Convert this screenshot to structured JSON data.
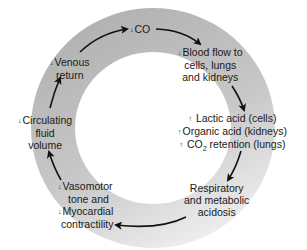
{
  "diagram": {
    "type": "cycle",
    "colors": {
      "ring_dark": "#b4b4b4",
      "ring_light": "#efefef",
      "arrow": "#111111",
      "text": "#1a1a1a"
    },
    "nodes": [
      {
        "id": "co",
        "arrow": "↓",
        "lines": [
          "CO"
        ]
      },
      {
        "id": "blood_flow",
        "arrow": "↓",
        "lines": [
          "Blood flow to",
          "cells, lungs",
          "and  kidneys"
        ]
      },
      {
        "id": "acids",
        "lines": [
          {
            "arrow": "↑",
            "text": "Lactic acid (cells)"
          },
          {
            "arrow": "↑",
            "text": "Organic acid (kidneys)"
          },
          {
            "arrow": "↑",
            "text_pre": "CO",
            "sub": "2",
            "text_post": " retention (lungs)"
          }
        ]
      },
      {
        "id": "acidosis",
        "lines": [
          "Respiratory",
          "and metabolic",
          "acidosis"
        ]
      },
      {
        "id": "vasomotor",
        "lines": [
          {
            "arrow": "↓",
            "text": "Vasomotor"
          },
          {
            "arrow": "",
            "text": "tone and"
          },
          {
            "arrow": "↓",
            "text": "Myocardial"
          },
          {
            "arrow": "",
            "text": "contractility"
          }
        ]
      },
      {
        "id": "circulating",
        "arrow": "↓",
        "lines": [
          "Circulating",
          "fluid",
          "volume"
        ]
      },
      {
        "id": "venous",
        "arrow": "↓",
        "lines": [
          "Venous",
          "return"
        ]
      }
    ],
    "edges": [
      [
        "venous",
        "co"
      ],
      [
        "co",
        "blood_flow"
      ],
      [
        "blood_flow",
        "acids"
      ],
      [
        "acids",
        "acidosis"
      ],
      [
        "acidosis",
        "vasomotor"
      ],
      [
        "vasomotor",
        "circulating"
      ],
      [
        "circulating",
        "venous"
      ]
    ]
  }
}
